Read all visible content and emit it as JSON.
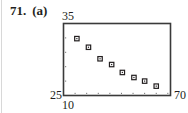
{
  "problem": {
    "number": "71.",
    "part": "(a)"
  },
  "window": {
    "xmin_label": "10",
    "xmax_label": "70",
    "ymin_label": "25",
    "ymax_label": "35"
  },
  "chart_data": {
    "type": "scatter",
    "title": "",
    "xlabel": "",
    "ylabel": "",
    "xlim": [
      10,
      70
    ],
    "ylim": [
      25,
      35
    ],
    "x_ticks_every": 6.5,
    "y_ticks_every": 2,
    "grid": false,
    "legend": null,
    "marker": "open-square",
    "series": [
      {
        "name": "data",
        "x": [
          17.5,
          24,
          30.5,
          37,
          43,
          49.5,
          55.5,
          62
        ],
        "y": [
          32.9,
          31.7,
          30.1,
          29.3,
          28.2,
          27.5,
          27.0,
          26.3
        ]
      }
    ],
    "annotations": [
      "71. (a)"
    ]
  },
  "colors": {
    "ink": "#231f20",
    "frame": "#3a3a3a",
    "rule": "#d8d8d8"
  }
}
